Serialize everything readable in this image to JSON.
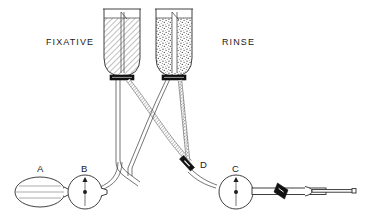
{
  "figure": {
    "background_color": "#ffffff",
    "line_color": "#2b2b2b",
    "accent_black": "#111111"
  },
  "labels": {
    "fixative": "FIXATIVE",
    "rinse": "RINSE",
    "a": "A",
    "b": "B",
    "c": "C",
    "d": "D"
  },
  "components": [
    {
      "id": "A",
      "name": "squeeze-bulb",
      "label": "A",
      "description": "ribbed compression bulb"
    },
    {
      "id": "B",
      "name": "valve-b",
      "label": "B",
      "description": "inline valve with upward arrow"
    },
    {
      "id": "C",
      "name": "valve-c",
      "label": "C",
      "description": "inline valve with upward arrow"
    },
    {
      "id": "D",
      "name": "pinch-clamp-d",
      "label": "D",
      "description": "pinch clamp on tubing"
    }
  ],
  "reservoirs": [
    {
      "name": "fixative-bottle",
      "label": "FIXATIVE",
      "fill_pattern": "diagonal-hatch"
    },
    {
      "name": "rinse-bottle",
      "label": "RINSE",
      "fill_pattern": "stipple"
    }
  ],
  "tubing": {
    "fixative_line_pattern": "hatched",
    "rinse_line_pattern": "stippled",
    "plain_line_pattern": "outline"
  },
  "cannula": {
    "name": "cannula-assembly",
    "clamp": "diagonal-clamp",
    "hub": "luer-hub",
    "needle": "needle-tip"
  }
}
